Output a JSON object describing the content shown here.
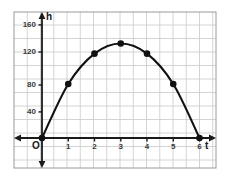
{
  "figure": {
    "background": "#ffffff",
    "grid_color": "#c9c9c9",
    "grid_border_color": "#9a9a9a",
    "axis_color": "#1a1a1a",
    "curve_color": "#111111",
    "point_color": "#111111",
    "label_color": "#3a3a3a",
    "origin_label": "O",
    "y_axis_name": "h",
    "x_axis_name": "t"
  },
  "chart_data": {
    "type": "line",
    "title": "",
    "subtitle": "",
    "xlabel": "t",
    "ylabel": "h",
    "x": [
      0,
      1,
      2,
      3,
      4,
      5,
      6
    ],
    "values": [
      0,
      80,
      125,
      140,
      125,
      80,
      0
    ],
    "series": [
      {
        "name": "h",
        "values": [
          0,
          80,
          125,
          140,
          125,
          80,
          0
        ]
      }
    ],
    "point_labels": [
      "",
      "",
      "",
      "",
      "",
      "",
      ""
    ],
    "xlim": [
      -0.9,
      6.9
    ],
    "ylim": [
      -20,
      180
    ],
    "xticks": [
      1,
      2,
      3,
      4,
      5,
      6
    ],
    "xtick_labels": [
      "1",
      "2",
      "3",
      "4",
      "5",
      "6"
    ],
    "yticks": [
      40,
      80,
      120,
      160
    ],
    "ytick_labels": [
      "40",
      "80",
      "120",
      "160"
    ],
    "grid": true,
    "legend": false,
    "legend_position": "none",
    "markers": true,
    "annotations": []
  }
}
